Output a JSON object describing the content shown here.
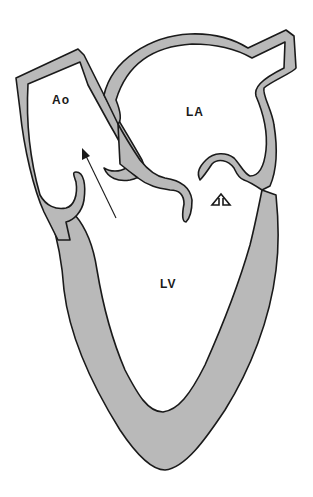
{
  "diagram": {
    "type": "anatomical heart cross-section (left heart)",
    "labels": {
      "aorta": "Ao",
      "left_atrium": "LA",
      "left_ventricle": "LV"
    },
    "annotations": {
      "outflow_arrow": "arrow from LV into Ao (ejection through aortic valve)",
      "mitral_arrow": "hollow up-arrow at mitral valve (LV to LA direction)"
    },
    "colors": {
      "wall_fill": "#b9b9b9",
      "outline": "#1a1a1a",
      "background": "#ffffff"
    }
  }
}
